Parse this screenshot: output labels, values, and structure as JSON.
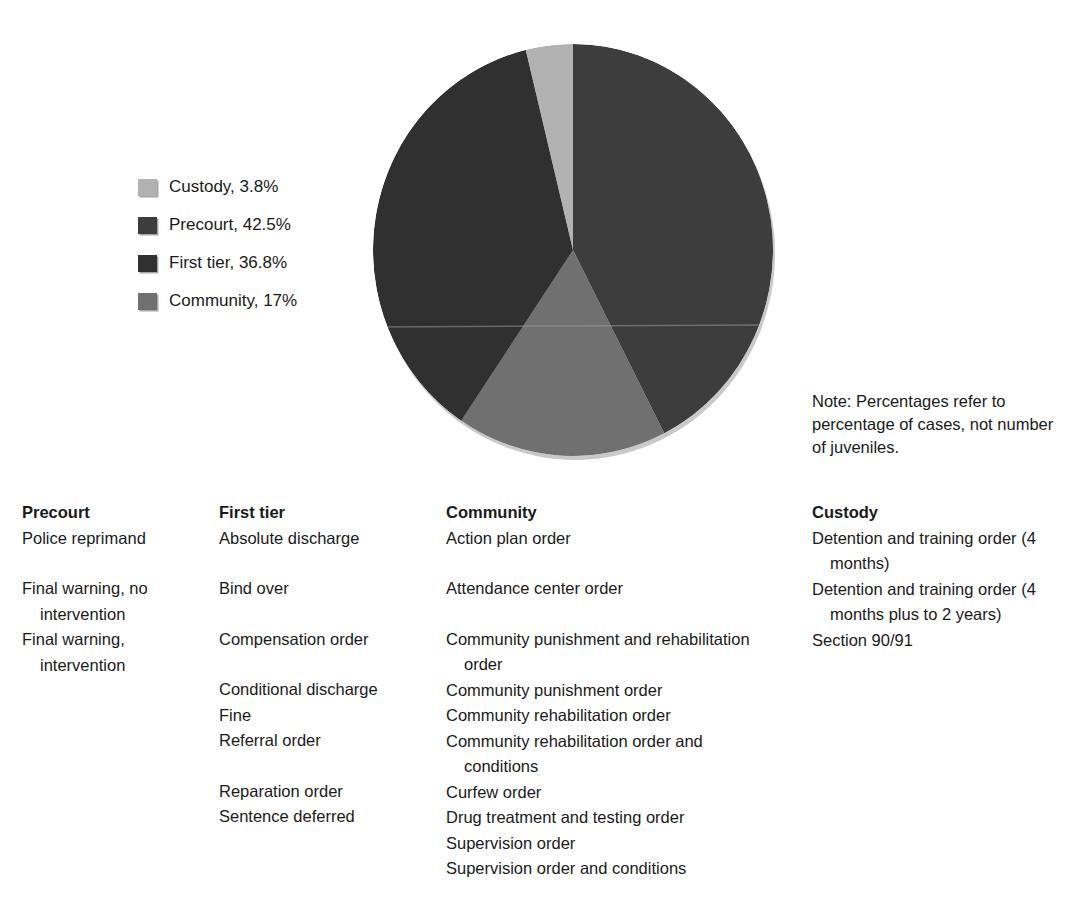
{
  "chart_data": {
    "type": "pie",
    "title": "",
    "legend_position": "left",
    "note": "Note: Percentages refer to percentage of cases, not number of juveniles.",
    "categories": [
      "Custody",
      "Precourt",
      "First tier",
      "Community"
    ],
    "values": [
      3.8,
      42.5,
      36.8,
      17
    ],
    "labels": [
      "Custody, 3.8%",
      "Precourt, 42.5%",
      "First tier, 36.8%",
      "Community, 17%"
    ],
    "colors": [
      "#b2b2b2",
      "#3d3d3d",
      "#303030",
      "#707070"
    ],
    "slice_order_clockwise_from_top": [
      "Precourt",
      "Community",
      "First tier",
      "Custody"
    ],
    "units": "percent of cases"
  },
  "legend": {
    "items": [
      {
        "label": "Custody, 3.8%",
        "name": "Custody",
        "percent": 3.8,
        "color": "#b2b2b2"
      },
      {
        "label": "Precourt, 42.5%",
        "name": "Precourt",
        "percent": 42.5,
        "color": "#3d3d3d"
      },
      {
        "label": "First tier, 36.8%",
        "name": "First tier",
        "percent": 36.8,
        "color": "#303030"
      },
      {
        "label": "Community, 17%",
        "name": "Community",
        "percent": 17,
        "color": "#707070"
      }
    ]
  },
  "note": {
    "text": "Note: Percentages refer to percentage of cases, not number of juveniles."
  },
  "columns": [
    {
      "heading": "Precourt",
      "entries": [
        {
          "text": "Police reprimand",
          "gap_before": false
        },
        {
          "text": "Final warning, no intervention",
          "gap_before": true
        },
        {
          "text": "Final warning, intervention",
          "gap_before": false
        }
      ]
    },
    {
      "heading": "First tier",
      "entries": [
        {
          "text": "Absolute discharge",
          "gap_before": false
        },
        {
          "text": "Bind over",
          "gap_before": true
        },
        {
          "text": "Compensation order",
          "gap_before": true
        },
        {
          "text": "Conditional discharge",
          "gap_before": true
        },
        {
          "text": "Fine",
          "gap_before": false
        },
        {
          "text": "Referral order",
          "gap_before": false
        },
        {
          "text": "Reparation order",
          "gap_before": true
        },
        {
          "text": "Sentence deferred",
          "gap_before": false
        }
      ]
    },
    {
      "heading": "Community",
      "entries": [
        {
          "text": "Action plan order",
          "gap_before": false
        },
        {
          "text": "Attendance center order",
          "gap_before": true
        },
        {
          "text": "Community punishment and rehabilitation order",
          "gap_before": true
        },
        {
          "text": "Community punishment order",
          "gap_before": false
        },
        {
          "text": "Community rehabilitation order",
          "gap_before": false
        },
        {
          "text": "Community rehabilitation order and conditions",
          "gap_before": false
        },
        {
          "text": "Curfew order",
          "gap_before": false
        },
        {
          "text": "Drug treatment and testing order",
          "gap_before": false
        },
        {
          "text": "Supervision order",
          "gap_before": false
        },
        {
          "text": "Supervision order and conditions",
          "gap_before": false
        }
      ]
    },
    {
      "heading": "Custody",
      "entries": [
        {
          "text": "Detention and training order (4 months)",
          "gap_before": false
        },
        {
          "text": "Detention and training order (4 months plus to 2 years)",
          "gap_before": false
        },
        {
          "text": "Section 90/91",
          "gap_before": false
        }
      ]
    }
  ]
}
